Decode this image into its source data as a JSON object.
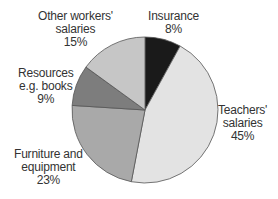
{
  "chart_data": {
    "type": "pie",
    "title": "",
    "start_angle_deg": 0,
    "direction": "clockwise",
    "slices": [
      {
        "label": "Insurance",
        "value": 8,
        "value_label": "8%",
        "color": "#1a1a1a"
      },
      {
        "label": "Teachers' salaries",
        "value": 45,
        "value_label": "45%",
        "color": "#e3e3e3"
      },
      {
        "label": "Furniture and equipment",
        "value": 23,
        "value_label": "23%",
        "color": "#a9a9a9"
      },
      {
        "label": "Resources e.g. books",
        "value": 9,
        "value_label": "9%",
        "color": "#7d7d7d"
      },
      {
        "label": "Other workers' salaries",
        "value": 15,
        "value_label": "15%",
        "color": "#c6c6c6"
      }
    ]
  },
  "labels": {
    "insurance": {
      "line1": "Insurance",
      "line2": "8%"
    },
    "teachers": {
      "line1": "Teachers'",
      "line2": "salaries",
      "line3": "45%"
    },
    "furniture": {
      "line1": "Furniture and",
      "line2": "equipment",
      "line3": "23%"
    },
    "resources": {
      "line1": "Resources",
      "line2": "e.g. books",
      "line3": "9%"
    },
    "other": {
      "line1": "Other workers'",
      "line2": "salaries",
      "line3": "15%"
    }
  }
}
